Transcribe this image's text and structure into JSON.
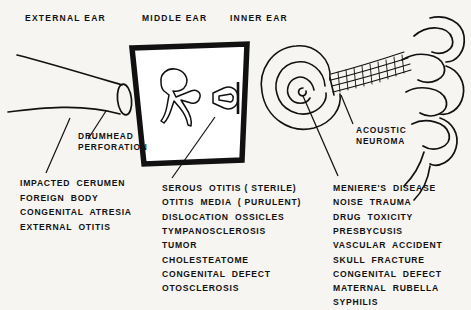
{
  "diagram": {
    "background_color": "#f6f5f2",
    "ink_color": "#111111"
  },
  "headers": [
    {
      "label": "EXTERNAL EAR",
      "x": 25,
      "y": 13
    },
    {
      "label": "MIDDLE EAR",
      "x": 142,
      "y": 13
    },
    {
      "label": "INNER EAR",
      "x": 230,
      "y": 13
    }
  ],
  "callouts": [
    {
      "name": "drumhead-perforation",
      "line1": "DRUMHEAD",
      "line2": "PERFORATION",
      "x": 78,
      "y": 131
    },
    {
      "name": "acoustic-neuroma",
      "line1": "ACOUSTIC",
      "line2": "NEUROMA",
      "x": 356,
      "y": 125
    }
  ],
  "columns": {
    "external_ear": {
      "name": "external-ear-causes",
      "x": 20,
      "y_start": 178,
      "items": [
        "IMPACTED  CERUMEN",
        "FOREIGN  BODY",
        "CONGENITAL  ATRESIA",
        "EXTERNAL  OTITIS"
      ]
    },
    "middle_ear": {
      "name": "middle-ear-causes",
      "x": 162,
      "y_start": 183,
      "items": [
        "SEROUS  OTITIS ( STERILE)",
        "OTITIS  MEDIA  ( PURULENT)",
        "DISLOCATION  OSSICLES",
        "TYMPANOSCLEROSIS",
        "TUMOR",
        "CHOLESTEATOME",
        "CONGENITAL  DEFECT",
        "OTOSCLEROSIS"
      ]
    },
    "inner_ear": {
      "name": "inner-ear-causes",
      "x": 333,
      "y_start": 183,
      "items": [
        "MENIERE'S  DISEASE",
        "NOISE  TRAUMA",
        "DRUG  TOXICITY",
        "PRESBYCUSIS",
        "VASCULAR  ACCIDENT",
        "SKULL  FRACTURE",
        "CONGENITAL  DEFECT",
        "MATERNAL  RUBELLA",
        "SYPHILIS"
      ]
    }
  },
  "artwork": {
    "ear_canal": "external-auditory-canal-funnel",
    "eardrum": "tympanic-membrane-ellipse",
    "middle_ear_box": "middle-ear-cavity-trapezoid",
    "ossicles": "malleus-incus-outline",
    "stapes": "stapes-stirrup-outline",
    "cochlea": "cochlea-spiral",
    "acoustic_nerve": "acoustic-nerve-hatched-bundle",
    "brainstem": "brainstem-contours"
  }
}
